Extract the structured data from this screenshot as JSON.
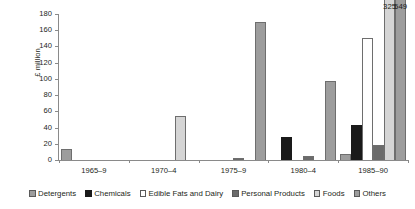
{
  "chart_data": {
    "type": "bar",
    "title": "",
    "xlabel": "",
    "ylabel": "£ million",
    "ylim": [
      0,
      180
    ],
    "ytick_step": 20,
    "yticks": [
      0,
      20,
      40,
      60,
      80,
      100,
      120,
      140,
      160,
      180
    ],
    "grid": false,
    "legend_position": "bottom",
    "categories": [
      "1965–9",
      "1970–4",
      "1975–9",
      "1980–4",
      "1985–90"
    ],
    "series": [
      {
        "name": "Detergents",
        "color": "#9d9d9d",
        "values": [
          14,
          0,
          0,
          0,
          8
        ]
      },
      {
        "name": "Chemicals",
        "color": "#1a1a1a",
        "values": [
          0,
          0,
          0,
          28,
          43
        ]
      },
      {
        "name": "Edible Fats and Dairy",
        "color": "#ffffff",
        "values": [
          0,
          0,
          0,
          0,
          150
        ]
      },
      {
        "name": "Personal Products",
        "color": "#6b6b6b",
        "values": [
          0,
          0,
          3,
          5,
          18
        ]
      },
      {
        "name": "Foods",
        "color": "#d5d5d5",
        "values": [
          0,
          54,
          0,
          0,
          325
        ]
      },
      {
        "name": "Others",
        "color": "#9d9d9d",
        "values": [
          0,
          0,
          170,
          97,
          549
        ]
      }
    ],
    "annotations": [
      {
        "label": "325",
        "category": "1985–90",
        "series": "Foods"
      },
      {
        "label": "549",
        "category": "1985–90",
        "series": "Others"
      }
    ]
  },
  "legend": {
    "items": [
      {
        "label": "Detergents"
      },
      {
        "label": "Chemicals"
      },
      {
        "label": "Edible Fats and Dairy"
      },
      {
        "label": "Personal Products"
      },
      {
        "label": "Foods"
      },
      {
        "label": "Others"
      }
    ]
  }
}
